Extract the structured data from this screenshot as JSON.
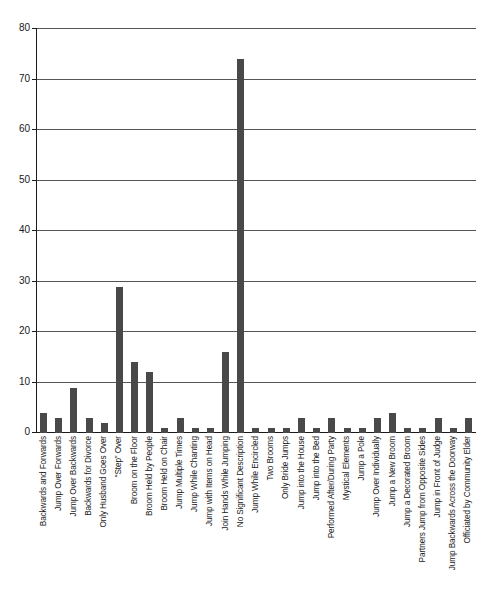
{
  "chart_data": {
    "type": "bar",
    "title": "",
    "subtitle": "",
    "xlabel": "",
    "ylabel": "",
    "ylim": [
      0,
      80
    ],
    "ytick_step": 10,
    "yticks": [
      0,
      10,
      20,
      30,
      40,
      50,
      60,
      70,
      80
    ],
    "grid": true,
    "legend": false,
    "bar_color": "#494949",
    "axis_color": "#1a1a1a",
    "gridline_color": "#555555",
    "background_color": "#ffffff",
    "categories": [
      "Backwards and Forwards",
      "Jump Over Forwards",
      "Jump Over Backwards",
      "Backwards for Divorce",
      "Only Husband Goes Over",
      "“Step” Over",
      "Broom on the Floor",
      "Broom Held by People",
      "Broom Held on Chair",
      "Jump Multiple Times",
      "Jump While Chanting",
      "Jump with Items on Head",
      "Join Hands While Jumping",
      "No Significant Description",
      "Jump While Encircled",
      "Two Brooms",
      "Only Bride Jumps",
      "Jump into the House",
      "Jump into the Bed",
      "Performed After/During Party",
      "Mystical Elements",
      "Jump a Pole",
      "Jump Over Individually",
      "Jump a New Broom",
      "Jump a Decorated Broom",
      "Partners Jump from Opposite Sides",
      "Jump in Front of Judge",
      "Jump Backwards Across the Doorway",
      "Officiated by Community Elder"
    ],
    "values": [
      4,
      3,
      9,
      3,
      2,
      29,
      14,
      12,
      1,
      3,
      1,
      1,
      16,
      74,
      1,
      1,
      1,
      3,
      1,
      3,
      1,
      1,
      3,
      4,
      1,
      1,
      3,
      1,
      3
    ]
  }
}
